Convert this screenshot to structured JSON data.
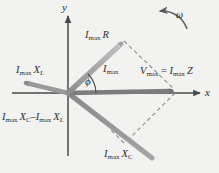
{
  "figure": {
    "kind": "phasor-diagram",
    "background_color": "#f2f2f0"
  },
  "axes": {
    "x_label": "x",
    "y_label": "y",
    "origin": {
      "x": 68,
      "y": 93
    },
    "x_axis": {
      "x1": 12,
      "y1": 93,
      "x2": 202,
      "y2": 93
    },
    "y_axis": {
      "x1": 68,
      "y1": 14,
      "x2": 68,
      "y2": 156
    },
    "axis_color": "#4a4a4a"
  },
  "labels": {
    "imax_r": {
      "main": "I",
      "sub": "max",
      "trail": "R"
    },
    "imax": {
      "main": "I",
      "sub": "max"
    },
    "vmax": {
      "main": "V",
      "sub": "max",
      "op": " = ",
      "main2": "I",
      "sub2": "max",
      "trail2": "Z"
    },
    "imax_xl": {
      "main": "I",
      "sub": "max",
      "trail": "X",
      "trailsub": "L"
    },
    "imax_xc": {
      "main": "I",
      "sub": "max",
      "trail": "X",
      "trailsub": "C"
    },
    "difference": {
      "main": "I",
      "sub": "max",
      "trail": "X",
      "trailsub": "C",
      "op": "–",
      "main2": "I",
      "sub2": "max",
      "trail2": "X",
      "trailsub2": "L"
    },
    "omega": "ω",
    "phi": "ϕ"
  },
  "phasors": [
    {
      "name": "imax-r-phasor",
      "label_key": "imax_r",
      "color": "#a8a8a8",
      "from": {
        "x": 68,
        "y": 93
      },
      "to": {
        "x": 124,
        "y": 40
      },
      "style": "solid-thick-arrow",
      "note": "resistor voltage, along current direction"
    },
    {
      "name": "vmax-phasor",
      "label_key": "vmax",
      "color": "#7a7a7a",
      "from": {
        "x": 68,
        "y": 93
      },
      "to": {
        "x": 176,
        "y": 91
      },
      "style": "solid-thick-arrow",
      "note": "total applied voltage, resultant"
    },
    {
      "name": "imax-xl-phasor",
      "label_key": "imax_xl",
      "color": "#8f8f8f",
      "from": {
        "x": 68,
        "y": 93
      },
      "to": {
        "x": 24,
        "y": 82
      },
      "style": "solid-thick-arrow",
      "note": "inductor voltage phasor pointing left"
    },
    {
      "name": "imax-xc-phasor",
      "label_key": "imax_xc",
      "color": "#8f8f8f",
      "from": {
        "x": 68,
        "y": 93
      },
      "to": {
        "x": 150,
        "y": 156
      },
      "style": "solid-thick-arrow-double",
      "note": "capacitor voltage phasor pointing down-right"
    },
    {
      "name": "current-phasor",
      "label_key": "imax",
      "color": "#8a8a8a",
      "from": {
        "x": 68,
        "y": 93
      },
      "to": {
        "x": 124,
        "y": 40
      },
      "style": "current-direction",
      "note": "current direction reference"
    }
  ],
  "construction_lines": [
    {
      "name": "dashed-top-right",
      "from": {
        "x": 124,
        "y": 40
      },
      "to": {
        "x": 176,
        "y": 91
      },
      "style": "dashed"
    },
    {
      "name": "dashed-bottom-right",
      "from": {
        "x": 176,
        "y": 91
      },
      "to": {
        "x": 124,
        "y": 143
      },
      "style": "dashed"
    },
    {
      "name": "dashed-bottom-left",
      "from": {
        "x": 124,
        "y": 143
      },
      "to": {
        "x": 112,
        "y": 131
      },
      "style": "dashed"
    }
  ],
  "angle_marker": {
    "name": "phi-angle",
    "symbol": "ϕ",
    "vertex": {
      "x": 68,
      "y": 93
    },
    "from_deg": 0,
    "to_deg": 43,
    "radius": 26
  },
  "rotation_indicator": {
    "name": "omega-rotation-arc",
    "symbol": "ω",
    "direction": "counterclockwise",
    "color": "#6a6a6a"
  }
}
